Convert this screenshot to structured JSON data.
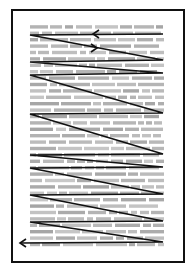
{
  "diagram": {
    "page": {
      "x": 11,
      "y": 9,
      "width": 172,
      "height": 252,
      "border_color": "#111111"
    },
    "text_block": {
      "x_start": 30,
      "x_end": 164,
      "y_start": 27,
      "y_end": 249,
      "line_spacing": 6.4,
      "color": "#9a9a9a"
    },
    "path": {
      "color": "#111111",
      "points": [
        [
          163,
          34
        ],
        [
          30,
          35
        ],
        [
          163,
          60
        ],
        [
          30,
          62
        ],
        [
          163,
          73
        ],
        [
          30,
          75
        ],
        [
          163,
          113
        ],
        [
          30,
          114
        ],
        [
          163,
          154
        ],
        [
          30,
          155
        ],
        [
          163,
          167
        ],
        [
          30,
          168
        ],
        [
          163,
          194
        ],
        [
          30,
          195
        ],
        [
          163,
          221
        ],
        [
          30,
          222
        ],
        [
          163,
          242
        ],
        [
          20,
          243
        ]
      ],
      "arrowheads": [
        {
          "x": 93,
          "y": 34,
          "direction": "left"
        },
        {
          "x": 97,
          "y": 48,
          "direction": "right"
        },
        {
          "x": 20,
          "y": 243,
          "direction": "left"
        }
      ]
    }
  }
}
